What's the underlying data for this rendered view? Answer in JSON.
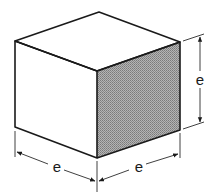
{
  "figure": {
    "shaded_face": "right",
    "colors": {
      "line": "#1a1a1a",
      "shade": "#9c9c9c",
      "background": "#ffffff"
    }
  },
  "dimensions": [
    {
      "id": "front-left-edge",
      "label": "e"
    },
    {
      "id": "front-right-edge",
      "label": "e"
    },
    {
      "id": "height",
      "label": "e"
    }
  ]
}
